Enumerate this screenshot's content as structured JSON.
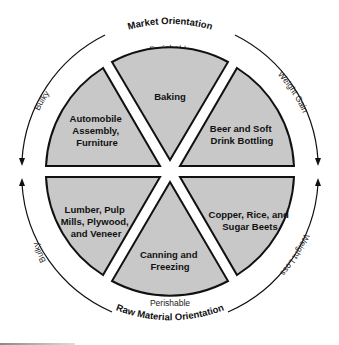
{
  "diagram": {
    "top_title": "Market Orientation",
    "bottom_title": "Raw Material Orientation",
    "ring_labels": {
      "top": "Perishable",
      "bottom": "Perishable",
      "upper_left": "Bulky",
      "lower_left": "Bulky",
      "upper_right": "Weight Gain",
      "lower_right": "Weight Loss"
    },
    "sectors": [
      {
        "id": "top",
        "lines": [
          "Baking"
        ]
      },
      {
        "id": "upper_right",
        "lines": [
          "Beer and Soft",
          "Drink Bottling"
        ]
      },
      {
        "id": "lower_right",
        "lines": [
          "Copper, Rice, and",
          "Sugar Beets"
        ]
      },
      {
        "id": "bottom",
        "lines": [
          "Canning and",
          "Freezing"
        ]
      },
      {
        "id": "lower_left",
        "lines": [
          "Lumber, Pulp",
          "Mills, Plywood,",
          "and Veneer"
        ]
      },
      {
        "id": "upper_left",
        "lines": [
          "Automobile",
          "Assembly,",
          "Furniture"
        ]
      }
    ],
    "colors": {
      "sector_fill": "#c8c8c8",
      "stroke": "#111111",
      "background": "#ffffff"
    }
  }
}
